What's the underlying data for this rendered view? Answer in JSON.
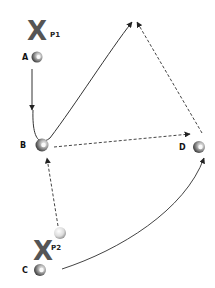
{
  "diagram": {
    "players": [
      {
        "id": "P1",
        "mark": "X",
        "label": "P1"
      },
      {
        "id": "P2",
        "mark": "X",
        "label": "P2"
      }
    ],
    "cones": [
      {
        "id": "A",
        "label": "A"
      },
      {
        "id": "B",
        "label": "B"
      },
      {
        "id": "C",
        "label": "C"
      },
      {
        "id": "D",
        "label": "D"
      }
    ],
    "ball": {
      "label": "ball"
    },
    "arrows": [
      {
        "from": "A",
        "to": "B",
        "style": "solid",
        "meaning": "run"
      },
      {
        "from": "B",
        "to": "apex",
        "style": "solid-curved",
        "meaning": "run"
      },
      {
        "from": "B",
        "to": "D",
        "style": "dashed",
        "meaning": "pass"
      },
      {
        "from": "D",
        "to": "apex",
        "style": "dashed",
        "meaning": "pass"
      },
      {
        "from": "P2-ball",
        "to": "B",
        "style": "dashed",
        "meaning": "pass"
      },
      {
        "from": "C",
        "to": "D",
        "style": "solid-curved",
        "meaning": "run"
      }
    ],
    "colors": {
      "line": "#333333",
      "dashed": "#444444",
      "x_mark": "#555555",
      "cone_dark": "#4a4a4a",
      "cone_light": "#e6e6e6"
    }
  }
}
